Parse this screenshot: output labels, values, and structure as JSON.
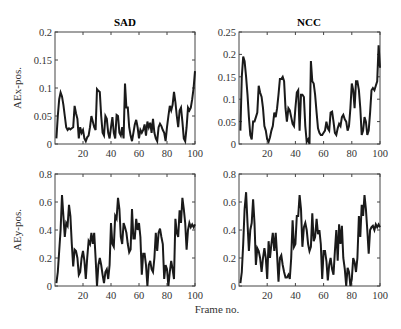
{
  "figure": {
    "xlabel": "Frame no."
  },
  "chart_data": [
    {
      "type": "line",
      "panel": "top-left",
      "title": "SAD",
      "xlabel": "",
      "ylabel": "AEx-pos.",
      "xlim": [
        0,
        100
      ],
      "ylim": [
        0,
        0.2
      ],
      "xticks": [
        20,
        40,
        60,
        80,
        100
      ],
      "yticks": [
        0,
        0.05,
        0.1,
        0.15,
        0.2
      ],
      "ytick_labels": [
        "0",
        "0.05",
        "0.1",
        "0.15",
        "0.2"
      ],
      "grid": false,
      "series": [
        {
          "name": "SAD AEx",
          "x": [
            1,
            2,
            3,
            4,
            5,
            6,
            7,
            8,
            9,
            10,
            11,
            12,
            13,
            14,
            15,
            16,
            17,
            18,
            19,
            20,
            21,
            22,
            23,
            24,
            25,
            26,
            27,
            28,
            29,
            30,
            31,
            32,
            33,
            34,
            35,
            36,
            37,
            38,
            39,
            40,
            41,
            42,
            43,
            44,
            45,
            46,
            47,
            48,
            49,
            50,
            51,
            52,
            53,
            54,
            55,
            56,
            57,
            58,
            59,
            60,
            61,
            62,
            63,
            64,
            65,
            66,
            67,
            68,
            69,
            70,
            71,
            72,
            73,
            74,
            75,
            76,
            77,
            78,
            79,
            80,
            81,
            82,
            83,
            84,
            85,
            86,
            87,
            88,
            89,
            90,
            91,
            92,
            93,
            94,
            95,
            96,
            97,
            98,
            99,
            100
          ],
          "values": [
            0.01,
            0.05,
            0.08,
            0.092,
            0.085,
            0.07,
            0.05,
            0.03,
            0.025,
            0.028,
            0.026,
            0.028,
            0.03,
            0.068,
            0.055,
            0.045,
            0.01,
            0.03,
            0.02,
            0.025,
            0.01,
            0.005,
            0.012,
            0.015,
            0.03,
            0.05,
            0.04,
            0.03,
            0.025,
            0.098,
            0.095,
            0.093,
            0.05,
            0.02,
            0.015,
            0.05,
            0.045,
            0.02,
            0.01,
            0.03,
            0.048,
            0.02,
            0.01,
            0.052,
            0.05,
            0.02,
            0.015,
            0.03,
            0.01,
            0.108,
            0.065,
            0.065,
            0.03,
            0.015,
            0.005,
            0.02,
            0.035,
            0.043,
            0.03,
            0.01,
            0.025,
            0.02,
            0.025,
            0.035,
            0.015,
            0.04,
            0.03,
            0.038,
            0.02,
            0.045,
            0.02,
            0.01,
            0.005,
            0.03,
            0.036,
            0.032,
            0.025,
            0.02,
            0.005,
            0.03,
            0.05,
            0.068,
            0.06,
            0.07,
            0.093,
            0.075,
            0.05,
            0.03,
            0.06,
            0.065,
            0.04,
            0.01,
            0.005,
            0.03,
            0.065,
            0.06,
            0.065,
            0.08,
            0.1,
            0.13
          ]
        }
      ]
    },
    {
      "type": "line",
      "panel": "top-right",
      "title": "NCC",
      "xlabel": "",
      "ylabel": "",
      "xlim": [
        0,
        100
      ],
      "ylim": [
        0,
        0.25
      ],
      "xticks": [
        20,
        40,
        60,
        80,
        100
      ],
      "yticks": [
        0,
        0.05,
        0.1,
        0.15,
        0.2,
        0.25
      ],
      "ytick_labels": [
        "0",
        "0.05",
        "0.1",
        "0.15",
        "0.2",
        "0.25"
      ],
      "grid": false,
      "series": [
        {
          "name": "NCC AEx",
          "x": [
            1,
            2,
            3,
            4,
            5,
            6,
            7,
            8,
            9,
            10,
            11,
            12,
            13,
            14,
            15,
            16,
            17,
            18,
            19,
            20,
            21,
            22,
            23,
            24,
            25,
            26,
            27,
            28,
            29,
            30,
            31,
            32,
            33,
            34,
            35,
            36,
            37,
            38,
            39,
            40,
            41,
            42,
            43,
            44,
            45,
            46,
            47,
            48,
            49,
            50,
            51,
            52,
            53,
            54,
            55,
            56,
            57,
            58,
            59,
            60,
            61,
            62,
            63,
            64,
            65,
            66,
            67,
            68,
            69,
            70,
            71,
            72,
            73,
            74,
            75,
            76,
            77,
            78,
            79,
            80,
            81,
            82,
            83,
            84,
            85,
            86,
            87,
            88,
            89,
            90,
            91,
            92,
            93,
            94,
            95,
            96,
            97,
            98,
            99,
            100
          ],
          "values": [
            0.03,
            0.15,
            0.195,
            0.185,
            0.15,
            0.11,
            0.06,
            0.02,
            0.01,
            0.05,
            0.05,
            0.06,
            0.07,
            0.13,
            0.115,
            0.105,
            0.08,
            0.04,
            0.03,
            0.01,
            0.005,
            0.015,
            0.03,
            0.04,
            0.07,
            0.06,
            0.08,
            0.11,
            0.145,
            0.145,
            0.15,
            0.14,
            0.08,
            0.05,
            0.08,
            0.075,
            0.06,
            0.045,
            0.04,
            0.08,
            0.115,
            0.12,
            0.03,
            0.11,
            0.11,
            0.105,
            0.04,
            0.005,
            0.01,
            0.0,
            0.185,
            0.14,
            0.135,
            0.11,
            0.07,
            0.035,
            0.025,
            0.02,
            0.02,
            0.025,
            0.03,
            0.05,
            0.035,
            0.03,
            0.07,
            0.072,
            0.05,
            0.025,
            0.02,
            0.035,
            0.045,
            0.04,
            0.06,
            0.065,
            0.055,
            0.05,
            0.03,
            0.04,
            0.08,
            0.135,
            0.12,
            0.08,
            0.14,
            0.14,
            0.12,
            0.08,
            0.02,
            0.03,
            0.06,
            0.05,
            0.02,
            0.03,
            0.07,
            0.12,
            0.125,
            0.12,
            0.13,
            0.14,
            0.22,
            0.17
          ]
        }
      ]
    },
    {
      "type": "line",
      "panel": "bottom-left",
      "title": "",
      "xlabel": "",
      "ylabel": "AEy-pos.",
      "xlim": [
        0,
        100
      ],
      "ylim": [
        0,
        0.8
      ],
      "xticks": [
        20,
        40,
        60,
        80,
        100
      ],
      "yticks": [
        0,
        0.2,
        0.4,
        0.6,
        0.8
      ],
      "ytick_labels": [
        "0",
        "0.2",
        "0.4",
        "0.6",
        "0.8"
      ],
      "grid": false,
      "series": [
        {
          "name": "SAD AEy",
          "x": [
            1,
            2,
            3,
            4,
            5,
            6,
            7,
            8,
            9,
            10,
            11,
            12,
            13,
            14,
            15,
            16,
            17,
            18,
            19,
            20,
            21,
            22,
            23,
            24,
            25,
            26,
            27,
            28,
            29,
            30,
            31,
            32,
            33,
            34,
            35,
            36,
            37,
            38,
            39,
            40,
            41,
            42,
            43,
            44,
            45,
            46,
            47,
            48,
            49,
            50,
            51,
            52,
            53,
            54,
            55,
            56,
            57,
            58,
            59,
            60,
            61,
            62,
            63,
            64,
            65,
            66,
            67,
            68,
            69,
            70,
            71,
            72,
            73,
            74,
            75,
            76,
            77,
            78,
            79,
            80,
            81,
            82,
            83,
            84,
            85,
            86,
            87,
            88,
            89,
            90,
            91,
            92,
            93,
            94,
            95,
            96,
            97,
            98,
            99,
            100
          ],
          "values": [
            0.02,
            0.1,
            0.25,
            0.4,
            0.65,
            0.5,
            0.35,
            0.45,
            0.43,
            0.58,
            0.5,
            0.3,
            0.14,
            0.26,
            0.25,
            0.2,
            0.08,
            0.1,
            0.2,
            0.25,
            0.18,
            0.05,
            0.2,
            0.32,
            0.3,
            0.38,
            0.3,
            0.38,
            0.2,
            0.0,
            0.15,
            0.2,
            0.15,
            0.08,
            0.02,
            0.1,
            0.12,
            0.05,
            0.15,
            0.45,
            0.3,
            0.28,
            0.5,
            0.48,
            0.63,
            0.55,
            0.35,
            0.3,
            0.45,
            0.42,
            0.38,
            0.3,
            0.24,
            0.26,
            0.55,
            0.34,
            0.34,
            0.48,
            0.4,
            0.45,
            0.35,
            0.08,
            0.23,
            0.23,
            0.15,
            0.0,
            0.15,
            0.18,
            0.12,
            0.1,
            0.2,
            0.38,
            0.25,
            0.38,
            0.41,
            0.35,
            0.3,
            0.05,
            0.15,
            0.12,
            0.0,
            0.1,
            0.18,
            0.12,
            0.05,
            0.48,
            0.38,
            0.35,
            0.54,
            0.45,
            0.63,
            0.55,
            0.45,
            0.26,
            0.4,
            0.45,
            0.42,
            0.44,
            0.42,
            0.44
          ]
        }
      ]
    },
    {
      "type": "line",
      "panel": "bottom-right",
      "title": "",
      "xlabel": "Frame no.",
      "ylabel": "",
      "xlim": [
        0,
        100
      ],
      "ylim": [
        0,
        0.8
      ],
      "xticks": [
        20,
        40,
        60,
        80,
        100
      ],
      "yticks": [
        0,
        0.2,
        0.4,
        0.6,
        0.8
      ],
      "ytick_labels": [
        "0",
        "0.2",
        "0.4",
        "0.6",
        "0.8"
      ],
      "grid": false,
      "series": [
        {
          "name": "NCC AEy",
          "x": [
            1,
            2,
            3,
            4,
            5,
            6,
            7,
            8,
            9,
            10,
            11,
            12,
            13,
            14,
            15,
            16,
            17,
            18,
            19,
            20,
            21,
            22,
            23,
            24,
            25,
            26,
            27,
            28,
            29,
            30,
            31,
            32,
            33,
            34,
            35,
            36,
            37,
            38,
            39,
            40,
            41,
            42,
            43,
            44,
            45,
            46,
            47,
            48,
            49,
            50,
            51,
            52,
            53,
            54,
            55,
            56,
            57,
            58,
            59,
            60,
            61,
            62,
            63,
            64,
            65,
            66,
            67,
            68,
            69,
            70,
            71,
            72,
            73,
            74,
            75,
            76,
            77,
            78,
            79,
            80,
            81,
            82,
            83,
            84,
            85,
            86,
            87,
            88,
            89,
            90,
            91,
            92,
            93,
            94,
            95,
            96,
            97,
            98,
            99,
            100
          ],
          "values": [
            0.02,
            0.1,
            0.3,
            0.55,
            0.67,
            0.45,
            0.25,
            0.4,
            0.45,
            0.62,
            0.45,
            0.15,
            0.27,
            0.25,
            0.2,
            0.1,
            0.2,
            0.27,
            0.2,
            0.05,
            0.32,
            0.2,
            0.3,
            0.38,
            0.25,
            0.38,
            0.22,
            0.03,
            0.2,
            0.22,
            0.15,
            0.1,
            0.06,
            0.06,
            0.08,
            0.05,
            0.2,
            0.47,
            0.28,
            0.3,
            0.5,
            0.5,
            0.65,
            0.55,
            0.28,
            0.42,
            0.45,
            0.4,
            0.3,
            0.25,
            0.28,
            0.52,
            0.32,
            0.35,
            0.48,
            0.37,
            0.4,
            0.3,
            0.05,
            0.25,
            0.25,
            0.18,
            0.04,
            0.15,
            0.2,
            0.12,
            0.08,
            0.25,
            0.4,
            0.18,
            0.44,
            0.3,
            0.43,
            0.2,
            0.12,
            0.0,
            0.13,
            0.1,
            0.0,
            0.05,
            0.2,
            0.17,
            0.1,
            0.2,
            0.5,
            0.35,
            0.58,
            0.5,
            0.65,
            0.55,
            0.4,
            0.23,
            0.4,
            0.42,
            0.43,
            0.4,
            0.44,
            0.42,
            0.44,
            0.42
          ]
        }
      ]
    }
  ]
}
